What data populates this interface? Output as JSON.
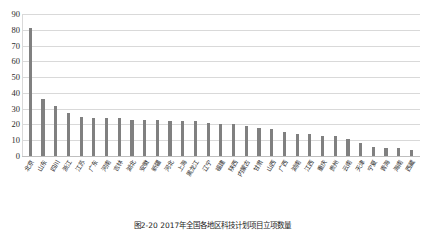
{
  "chart_data": {
    "type": "bar",
    "title": "",
    "xlabel": "",
    "ylabel": "",
    "ylim": [
      0,
      90
    ],
    "yticks": [
      0,
      10,
      20,
      30,
      40,
      50,
      60,
      70,
      80,
      90
    ],
    "grid": true,
    "legend": null,
    "bar_color": "#808080",
    "gridline_color": "#d9d9d9",
    "categories": [
      "北京",
      "山东",
      "四川",
      "浙江",
      "江苏",
      "广东",
      "河南",
      "吉林",
      "湖北",
      "安徽",
      "新疆",
      "河北",
      "上海",
      "黑龙江",
      "辽宁",
      "福建",
      "陕西",
      "内蒙古",
      "甘肃",
      "山西",
      "广西",
      "湖南",
      "江西",
      "重庆",
      "贵州",
      "云南",
      "天津",
      "宁夏",
      "青海",
      "海南",
      "西藏"
    ],
    "values": [
      81,
      36,
      32,
      27,
      25,
      24,
      24,
      24,
      23,
      23,
      23,
      22,
      22,
      22,
      21,
      20,
      20,
      19,
      18,
      17,
      15,
      14,
      14,
      13,
      13,
      11,
      8,
      6,
      5,
      5,
      4
    ]
  },
  "caption": {
    "text": "图2-20  2017年全国各地区科技计划项目立项数量"
  }
}
